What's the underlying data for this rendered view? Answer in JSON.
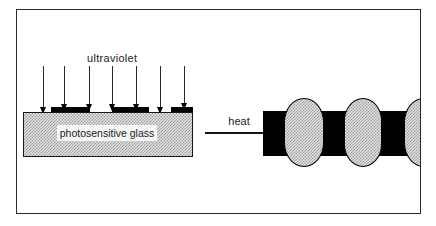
{
  "diagram": {
    "ultraviolet_label": "ultraviolet",
    "glass_label": "photosensitive glass",
    "heat_label": "heat",
    "colors": {
      "ink": "#1c1c1c",
      "mask_black": "#000000",
      "stipple_base": "#e2e2e2",
      "stipple_dot": "#9c9c9c",
      "frame_border": "#2b2b2b",
      "background": "#ffffff"
    }
  }
}
